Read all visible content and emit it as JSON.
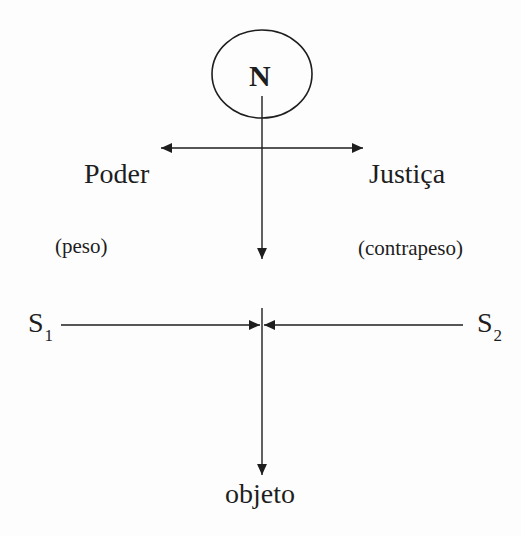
{
  "diagram": {
    "type": "force-diagram",
    "colors": {
      "stroke": "#1e1e1e",
      "background": "#fdfdfd"
    },
    "top_node": {
      "label": "N",
      "shape": "ellipse"
    },
    "left_force": {
      "label": "Poder",
      "role": "(peso)"
    },
    "right_force": {
      "label": "Justiça",
      "role": "(contrapeso)"
    },
    "subjects": [
      {
        "letter": "S",
        "index": "1"
      },
      {
        "letter": "S",
        "index": "2"
      }
    ],
    "bottom_node": {
      "label": "objeto"
    },
    "edges": [
      {
        "from": "N",
        "to": "Poder",
        "direction": "left"
      },
      {
        "from": "N",
        "to": "Justiça",
        "direction": "right"
      },
      {
        "from": "N",
        "to": "center",
        "direction": "down"
      },
      {
        "from": "S1",
        "to": "center",
        "direction": "right"
      },
      {
        "from": "S2",
        "to": "center",
        "direction": "left"
      },
      {
        "from": "center",
        "to": "objeto",
        "direction": "down"
      }
    ]
  }
}
